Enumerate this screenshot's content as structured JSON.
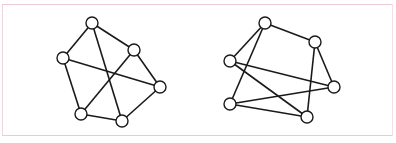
{
  "figure": {
    "border_color": "#ecc9d3",
    "stroke_color": "#1a1a1a",
    "node_fill": "#ffffff",
    "node_radius": 6
  },
  "graphs": [
    {
      "name": "left-graph",
      "nodes": [
        {
          "id": "A",
          "x": 92,
          "y": 23
        },
        {
          "id": "B",
          "x": 63,
          "y": 58
        },
        {
          "id": "C",
          "x": 134,
          "y": 50
        },
        {
          "id": "D",
          "x": 160,
          "y": 87
        },
        {
          "id": "E",
          "x": 81,
          "y": 114
        },
        {
          "id": "F",
          "x": 122,
          "y": 121
        }
      ],
      "edges": [
        [
          "A",
          "B"
        ],
        [
          "A",
          "C"
        ],
        [
          "A",
          "F"
        ],
        [
          "B",
          "E"
        ],
        [
          "B",
          "D"
        ],
        [
          "C",
          "D"
        ],
        [
          "C",
          "E"
        ],
        [
          "D",
          "F"
        ],
        [
          "E",
          "F"
        ]
      ]
    },
    {
      "name": "right-graph",
      "nodes": [
        {
          "id": "A",
          "x": 265,
          "y": 23
        },
        {
          "id": "B",
          "x": 230,
          "y": 61
        },
        {
          "id": "C",
          "x": 315,
          "y": 42
        },
        {
          "id": "D",
          "x": 334,
          "y": 87
        },
        {
          "id": "E",
          "x": 230,
          "y": 104
        },
        {
          "id": "F",
          "x": 307,
          "y": 117
        }
      ],
      "edges": [
        [
          "A",
          "B"
        ],
        [
          "A",
          "E"
        ],
        [
          "A",
          "C"
        ],
        [
          "B",
          "D"
        ],
        [
          "B",
          "F"
        ],
        [
          "C",
          "D"
        ],
        [
          "C",
          "F"
        ],
        [
          "E",
          "D"
        ],
        [
          "E",
          "F"
        ]
      ]
    }
  ]
}
